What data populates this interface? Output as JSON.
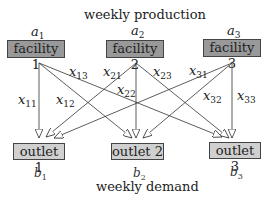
{
  "top_label": "weekly production",
  "bottom_label": "weekly demand",
  "supplies": [
    {
      "var": "a",
      "sub": "1",
      "name": "facility 1"
    },
    {
      "var": "a",
      "sub": "2",
      "name": "facility 2"
    },
    {
      "var": "a",
      "sub": "3",
      "name": "facility 3"
    }
  ],
  "demands": [
    {
      "var": "b",
      "sub": "1",
      "name": "outlet 1"
    },
    {
      "var": "b",
      "sub": "2",
      "name": "outlet 2"
    },
    {
      "var": "b",
      "sub": "3",
      "name": "outlet 3"
    }
  ],
  "flows": [
    {
      "var": "x",
      "sub": "11"
    },
    {
      "var": "x",
      "sub": "12"
    },
    {
      "var": "x",
      "sub": "13"
    },
    {
      "var": "x",
      "sub": "21"
    },
    {
      "var": "x",
      "sub": "22"
    },
    {
      "var": "x",
      "sub": "23"
    },
    {
      "var": "x",
      "sub": "31"
    },
    {
      "var": "x",
      "sub": "32"
    },
    {
      "var": "x",
      "sub": "33"
    }
  ],
  "colors": {
    "facility_fill": "#999999",
    "outlet_fill": "#d0d0d0",
    "line": "#333333"
  }
}
